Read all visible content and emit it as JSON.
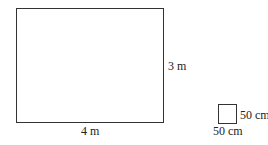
{
  "diagram": {
    "large_rectangle": {
      "width_label": "4 m",
      "height_label": "3 m"
    },
    "small_square": {
      "side_label_right": "50 cm",
      "side_label_bottom": "50 cm"
    }
  }
}
